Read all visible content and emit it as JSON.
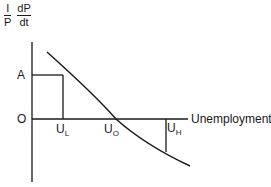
{
  "y_axis_label": {
    "frac1": {
      "numerator": "I",
      "denominator": "P"
    },
    "frac2": {
      "numerator": "dP",
      "denominator": "dt"
    }
  },
  "x_axis_label": "Unemployment",
  "labels": {
    "A": "A",
    "origin": "O",
    "UL": {
      "base": "U",
      "sub": "L"
    },
    "U0": {
      "base": "U",
      "sub": "O"
    },
    "UH": {
      "base": "U",
      "sub": "H"
    }
  }
}
